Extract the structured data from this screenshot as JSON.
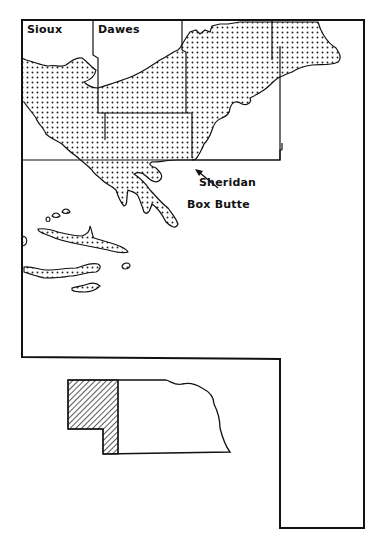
{
  "map": {
    "labels": {
      "sioux": "Sioux",
      "dawes": "Dawes",
      "sheridan": "Sheridan",
      "box_butte": "Box Butte"
    },
    "legend": {
      "stipple_meaning": "dotted area",
      "hatch_meaning": "inset highlighted region"
    },
    "colors": {
      "ink": "#111111",
      "background": "#ffffff"
    },
    "inset": {
      "name": "Nebraska locator map",
      "highlighted": "northwest panhandle"
    }
  }
}
